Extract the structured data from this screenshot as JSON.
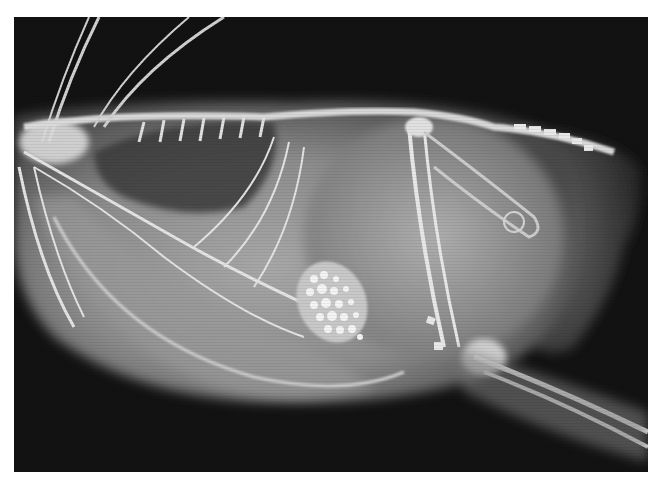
{
  "image": {
    "description": "Lateral radiograph (X-ray) of a bird showing skeleton, body cavity and a dense granular mass (grit/stones) in the gizzard region",
    "colors": {
      "background": "#121212",
      "soft_tissue": "#8a8a8a",
      "bone": "#e8e8e8",
      "border": "#ffffff"
    }
  }
}
